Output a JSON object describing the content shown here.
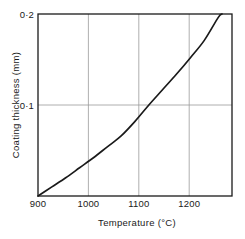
{
  "chart_data": {
    "type": "line",
    "title": "",
    "xlabel": "Temperature (°C)",
    "ylabel": "Coating thickness (mm)",
    "xlim": [
      900,
      1250
    ],
    "ylim": [
      0,
      0.2
    ],
    "grid": true,
    "legend": null,
    "x_ticks": [
      900,
      1000,
      1100,
      1200
    ],
    "x_tick_labels": [
      "900",
      "1000",
      "1100",
      "1200"
    ],
    "y_ticks": [
      0.1,
      0.2
    ],
    "y_tick_labels": [
      "0·1",
      "0·2"
    ],
    "series": [
      {
        "name": "Coating thickness vs temperature",
        "x": [
          900,
          925,
          950,
          975,
          1000,
          1025,
          1050,
          1075,
          1100,
          1125,
          1150,
          1175,
          1200,
          1225,
          1232
        ],
        "y": [
          0.0,
          0.01,
          0.02,
          0.031,
          0.042,
          0.054,
          0.066,
          0.082,
          0.1,
          0.117,
          0.134,
          0.152,
          0.171,
          0.196,
          0.2
        ]
      }
    ],
    "colors": {
      "curve": "#1a1a1a",
      "grid": "#9b9b9b",
      "frame": "#1a1a1a",
      "background": "#ffffff",
      "text": "#1a1a1a"
    }
  },
  "axes": {
    "x_title": "Temperature (°C)",
    "y_title": "Coating thickness (mm)",
    "x_labels": [
      "900",
      "1000",
      "1100",
      "1200"
    ],
    "y_labels": [
      "0·1",
      "0·2"
    ]
  }
}
